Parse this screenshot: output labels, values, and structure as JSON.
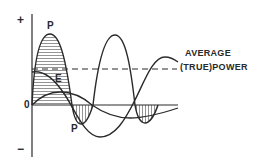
{
  "diagram": {
    "title": "",
    "labels": {
      "plus": "+",
      "minus": "−",
      "origin": "0",
      "power_top": "P",
      "power_bottom": "P",
      "voltage": "E",
      "average_line_1": "AVERAGE",
      "average_line_2": "(TRUE)POWER"
    },
    "colors": {
      "stroke": "#2a2a2a",
      "hatch": "#555555",
      "background": "#ffffff"
    },
    "curves": [
      {
        "name": "power",
        "label": "P",
        "description": "instantaneous power, shaded positive and negative loops"
      },
      {
        "name": "voltage",
        "label": "E",
        "description": "voltage waveform"
      },
      {
        "name": "current",
        "label": "",
        "description": "current waveform lagging voltage"
      }
    ],
    "reference_lines": [
      {
        "name": "zero-axis",
        "style": "solid"
      },
      {
        "name": "average-true-power",
        "style": "dashed"
      }
    ]
  }
}
